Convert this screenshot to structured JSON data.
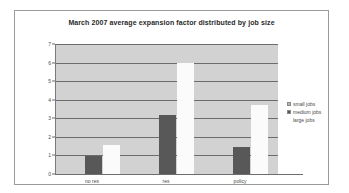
{
  "chart_data": {
    "type": "bar",
    "title": "March 2007 average expansion factor distributed by job size",
    "xlabel": "",
    "ylabel": "",
    "categories": [
      "no res",
      "res",
      "policy"
    ],
    "series": [
      {
        "name": "small jobs",
        "color": "#b5b5b5",
        "values": [
          0,
          0,
          0
        ]
      },
      {
        "name": "medium jobs",
        "color": "#585858",
        "values": [
          0.95,
          3.2,
          1.45
        ]
      },
      {
        "name": "large jobs",
        "color": "#ffffff",
        "values": [
          1.55,
          6.0,
          3.7
        ]
      }
    ],
    "ylim": [
      0,
      7
    ],
    "yticks": [
      0,
      1,
      2,
      3,
      4,
      5,
      6,
      7
    ],
    "grid": true,
    "legend_position": "right",
    "plot_background": "#d2d2d2",
    "gridline_color": "#6d6d6d"
  }
}
